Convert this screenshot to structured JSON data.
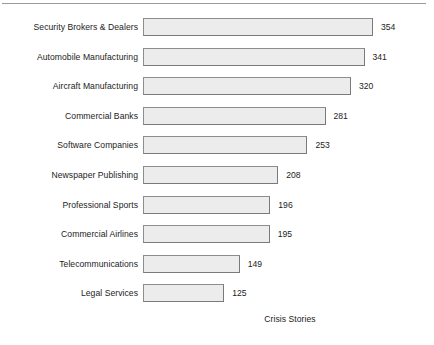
{
  "chart_data": {
    "type": "bar",
    "orientation": "horizontal",
    "title": "",
    "xlabel": "Crisis Stories",
    "ylabel": "",
    "grid": false,
    "legend": "none",
    "xlim": [
      0,
      354
    ],
    "categories": [
      "Security Brokers & Dealers",
      "Automobile Manufacturing",
      "Aircraft Manufacturing",
      "Commercial Banks",
      "Software Companies",
      "Newspaper Publishing",
      "Professional Sports",
      "Commercial Airlines",
      "Telecommunications",
      "Legal Services"
    ],
    "values": [
      354,
      341,
      320,
      281,
      253,
      208,
      196,
      195,
      149,
      125
    ],
    "value_labels": [
      "354",
      "341",
      "320",
      "281",
      "253",
      "208",
      "196",
      "195",
      "149",
      "125"
    ]
  },
  "style": {
    "bar_fill": "#ececec",
    "bar_border": "#8d8d8d",
    "text_color": "#1c1c1c",
    "rule_color": "#9a9a9a",
    "background": "#ffffff"
  }
}
